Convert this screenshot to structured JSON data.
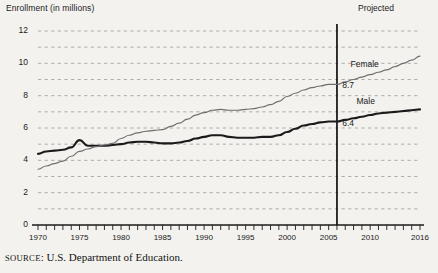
{
  "header": {
    "axis_title": "Enrollment (in millions)",
    "projected_label": "Projected"
  },
  "source": {
    "prefix": "SOURCE",
    "text": ": U.S. Department of Education."
  },
  "labels": {
    "female": "Female",
    "male": "Male",
    "female_value": "8.7",
    "male_value": "6.4"
  },
  "chart_data": {
    "type": "line",
    "title": "Enrollment (in millions)",
    "xlabel": "",
    "ylabel": "Enrollment (in millions)",
    "xlim": [
      1970,
      2016
    ],
    "ylim": [
      0,
      12
    ],
    "ytick_labels": [
      "0",
      "2",
      "4",
      "6",
      "8",
      "10",
      "12"
    ],
    "yticks": [
      0,
      2,
      4,
      6,
      8,
      10,
      12
    ],
    "grid": "horizontal-dashed-every-1",
    "xtick_labels": [
      "1970",
      "1975",
      "1980",
      "1985",
      "1990",
      "1995",
      "2000",
      "2005",
      "2010",
      "2016"
    ],
    "xticks": [
      1970,
      1975,
      1980,
      1985,
      1990,
      1995,
      2000,
      2005,
      2010,
      2016
    ],
    "xtick_minor_every": 1,
    "legend": "inline-series-labels",
    "annotations": [
      {
        "text": "Projected",
        "x": 2011,
        "y": 12.6
      },
      {
        "text": "Female",
        "x": 2011,
        "y": 9.9
      },
      {
        "text": "Male",
        "x": 2011,
        "y": 7.6
      },
      {
        "text": "8.7",
        "x": 2006.4,
        "y": 8.7
      },
      {
        "text": "6.4",
        "x": 2006.4,
        "y": 6.4
      }
    ],
    "projection_divider_x": 2006,
    "x": [
      1970,
      1971,
      1972,
      1973,
      1974,
      1975,
      1976,
      1977,
      1978,
      1979,
      1980,
      1981,
      1982,
      1983,
      1984,
      1985,
      1986,
      1987,
      1988,
      1989,
      1990,
      1991,
      1992,
      1993,
      1994,
      1995,
      1996,
      1997,
      1998,
      1999,
      2000,
      2001,
      2002,
      2003,
      2004,
      2005,
      2006,
      2007,
      2008,
      2009,
      2010,
      2011,
      2012,
      2013,
      2014,
      2015,
      2016
    ],
    "series": [
      {
        "name": "Male",
        "color": "#1a1a1a",
        "values": [
          4.4,
          4.55,
          4.6,
          4.65,
          4.8,
          5.25,
          4.9,
          4.9,
          4.9,
          4.95,
          5.0,
          5.1,
          5.15,
          5.15,
          5.1,
          5.05,
          5.05,
          5.1,
          5.2,
          5.35,
          5.45,
          5.55,
          5.55,
          5.45,
          5.4,
          5.4,
          5.4,
          5.45,
          5.45,
          5.55,
          5.75,
          5.95,
          6.15,
          6.25,
          6.35,
          6.4,
          6.4,
          6.5,
          6.6,
          6.7,
          6.8,
          6.9,
          6.95,
          7.0,
          7.05,
          7.1,
          7.15
        ]
      },
      {
        "name": "Female",
        "color": "#6e6e6e",
        "values": [
          3.45,
          3.65,
          3.8,
          3.95,
          4.25,
          4.55,
          4.7,
          4.85,
          4.95,
          5.05,
          5.35,
          5.55,
          5.7,
          5.8,
          5.85,
          5.9,
          6.1,
          6.3,
          6.55,
          6.8,
          6.95,
          7.1,
          7.15,
          7.1,
          7.1,
          7.15,
          7.2,
          7.3,
          7.45,
          7.65,
          7.95,
          8.15,
          8.35,
          8.5,
          8.6,
          8.7,
          8.7,
          8.85,
          9.0,
          9.15,
          9.3,
          9.45,
          9.6,
          9.8,
          10.0,
          10.2,
          10.45
        ]
      }
    ]
  }
}
